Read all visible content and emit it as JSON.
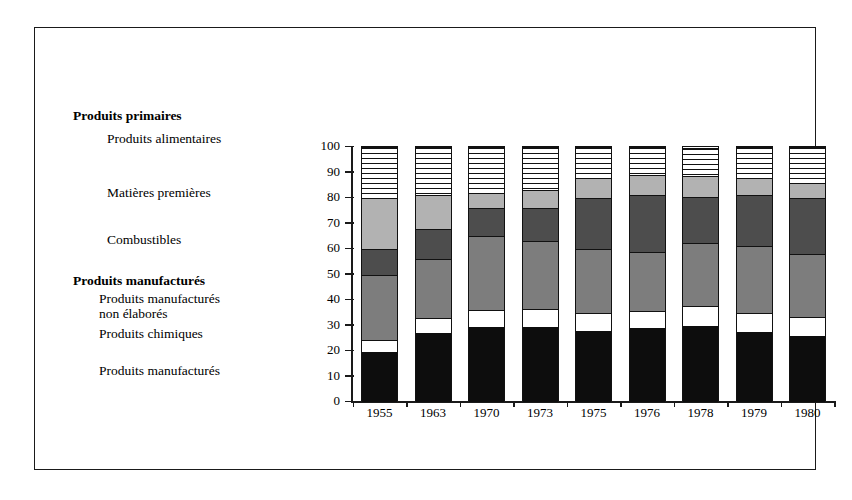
{
  "legend": {
    "items": [
      {
        "label": "Produits primaires",
        "bold": true,
        "x": 0,
        "y": 0
      },
      {
        "label": "Produits alimentaires",
        "bold": false,
        "x": 34,
        "y": 23
      },
      {
        "label": "Matières premières",
        "bold": false,
        "x": 34,
        "y": 77
      },
      {
        "label": "Combustibles",
        "bold": false,
        "x": 34,
        "y": 124
      },
      {
        "label": "Produits manufacturés",
        "bold": true,
        "x": 0,
        "y": 165
      },
      {
        "label": "Produits manufacturés",
        "bold": false,
        "x": 26,
        "y": 183
      },
      {
        "label": "non élaborés",
        "bold": false,
        "x": 26,
        "y": 198
      },
      {
        "label": "Produits chimiques",
        "bold": false,
        "x": 26,
        "y": 218
      },
      {
        "label": "Produits manufacturés",
        "bold": false,
        "x": 26,
        "y": 255
      }
    ]
  },
  "axis": {
    "ticks": [
      "100",
      "90",
      "80",
      "70",
      "60",
      "50",
      "40",
      "30",
      "20",
      "10",
      "0"
    ],
    "min": 0,
    "max": 100
  },
  "chart_data": {
    "type": "bar",
    "stacked": true,
    "title": "",
    "xlabel": "",
    "ylabel": "",
    "ylim": [
      0,
      100
    ],
    "grid": false,
    "legend_position": "left",
    "categories": [
      "1955",
      "1963",
      "1970",
      "1973",
      "1975",
      "1976",
      "1978",
      "1979",
      "1980"
    ],
    "series": [
      {
        "name": "Produits manufacturés",
        "color": "#0d0d0d",
        "fill": "black",
        "values": [
          19.5,
          27.0,
          29.5,
          29.5,
          28.0,
          29.0,
          30.0,
          27.5,
          26.0
        ]
      },
      {
        "name": "Produits chimiques",
        "color": "#ffffff",
        "fill": "white",
        "values": [
          5.0,
          6.0,
          6.5,
          7.0,
          7.0,
          6.5,
          7.5,
          7.5,
          7.5
        ]
      },
      {
        "name": "Produits manufacturés non élaborés",
        "color": "#7d7d7d",
        "fill": "medium-gray",
        "values": [
          25.5,
          23.0,
          29.0,
          26.5,
          25.0,
          23.5,
          25.0,
          26.0,
          24.5
        ]
      },
      {
        "name": "Combustibles",
        "color": "#4d4d4d",
        "fill": "dark-gray",
        "values": [
          10.0,
          12.0,
          11.0,
          13.0,
          20.0,
          22.0,
          18.0,
          20.0,
          22.0
        ]
      },
      {
        "name": "Matières premières",
        "color": "#b2b2b2",
        "fill": "light-gray",
        "values": [
          20.0,
          13.0,
          6.0,
          7.0,
          8.0,
          8.0,
          8.0,
          7.0,
          6.0
        ]
      },
      {
        "name": "Produits alimentaires",
        "color": "#hatch",
        "fill": "horizontal-hatch",
        "values": [
          20.0,
          19.0,
          18.0,
          17.0,
          12.0,
          11.0,
          11.0,
          12.0,
          14.0
        ]
      }
    ],
    "cumulative_tops": {
      "1955": [
        19.5,
        24.5,
        50,
        60,
        80,
        100
      ],
      "1963": [
        27,
        33,
        56,
        68,
        81,
        100
      ],
      "1970": [
        29.5,
        36,
        65,
        76,
        82,
        100
      ],
      "1973": [
        29.5,
        36.5,
        63,
        76,
        83,
        100
      ],
      "1975": [
        28,
        35,
        60,
        80,
        88,
        100
      ],
      "1976": [
        29,
        35.5,
        59,
        81,
        89,
        100
      ],
      "1978": [
        30,
        37.5,
        62.5,
        81,
        89,
        100
      ],
      "1979": [
        27.5,
        35,
        61,
        81,
        88,
        100
      ],
      "1980": [
        26,
        33.5,
        58,
        80,
        86,
        100
      ]
    }
  }
}
